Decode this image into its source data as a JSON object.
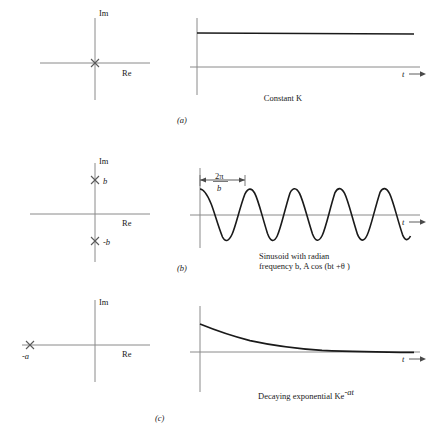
{
  "figure": {
    "title": "",
    "rows": [
      {
        "id": "a",
        "subfig_label": "(a)",
        "splane": {
          "im_label": "Im",
          "re_label": "Re",
          "poles": [
            {
              "label": "",
              "re": 0,
              "im": 0
            }
          ]
        },
        "response": {
          "t_label": "t",
          "caption_line1": "Constant K",
          "caption_line2": "",
          "period_label_num": "",
          "period_label_den": ""
        }
      },
      {
        "id": "b",
        "subfig_label": "(b)",
        "splane": {
          "im_label": "Im",
          "re_label": "Re",
          "poles": [
            {
              "label": "b",
              "re": 0,
              "im": 1
            },
            {
              "label": "-b",
              "re": 0,
              "im": -1
            }
          ]
        },
        "response": {
          "t_label": "t",
          "caption_line1": "Sinusoid with radian",
          "caption_line2": "frequency b, A cos (bt +θ )",
          "period_label_num": "2π",
          "period_label_den": "b"
        }
      },
      {
        "id": "c",
        "subfig_label": "(c)",
        "splane": {
          "im_label": "Im",
          "re_label": "Re",
          "poles": [
            {
              "label": "-a",
              "re": -1,
              "im": 0
            }
          ]
        },
        "response": {
          "t_label": "t",
          "caption_line1": "Decaying exponential Ke",
          "caption_line2": "-at",
          "period_label_num": "",
          "period_label_den": ""
        }
      }
    ],
    "colors": {
      "axis": "#8a8a8a",
      "curve": "#1a1a1a",
      "pole": "#5a5a5a",
      "text": "#1a1a1a",
      "background": "#ffffff"
    }
  }
}
